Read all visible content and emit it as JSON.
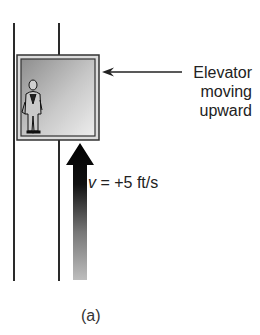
{
  "diagram": {
    "callout": {
      "line1": "Elevator",
      "line2": "moving",
      "line3": "upward"
    },
    "velocity_label": {
      "symbol": "v",
      "value": " = +5 ft/s"
    },
    "caption": "(a)",
    "colors": {
      "line": "#2a2a2a",
      "elevator_frame": "#3a3a3a",
      "elevator_fill_light": "#e6e6e6",
      "elevator_fill_dark": "#9a9a9a",
      "arrow_top": "#000000",
      "arrow_bottom": "#b0b0b0"
    }
  }
}
